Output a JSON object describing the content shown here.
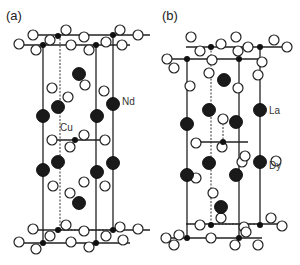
{
  "figure": {
    "panels": [
      {
        "id": "a",
        "label": "(a)",
        "label_pos": [
          6,
          20
        ],
        "atom_labels": [
          {
            "text": "Nd",
            "x": 122,
            "y": 101,
            "element": "Nd"
          },
          {
            "text": "Cu",
            "x": 60,
            "y": 127,
            "element": "Cu"
          }
        ],
        "solid_lines": [
          [
            [
              43,
              45
            ],
            [
              43,
              243
            ]
          ],
          [
            [
              96,
              45
            ],
            [
              96,
              243
            ]
          ],
          [
            [
              113,
              35
            ],
            [
              113,
              230
            ]
          ],
          [
            [
              36,
              35
            ],
            [
              150,
              35
            ]
          ],
          [
            [
              18,
              45
            ],
            [
              130,
              45
            ]
          ],
          [
            [
              18,
              243
            ],
            [
              130,
              243
            ]
          ],
          [
            [
              36,
              230
            ],
            [
              150,
              230
            ]
          ],
          [
            [
              55,
              140
            ],
            [
              103,
              140
            ]
          ]
        ],
        "dashed_lines": [
          [
            [
              60,
              35
            ],
            [
              60,
              230
            ]
          ],
          [
            [
              60,
              230
            ],
            [
              113,
              230
            ]
          ]
        ],
        "open_atoms": [
          [
            33,
            35
          ],
          [
            66,
            30
          ],
          [
            84,
            37
          ],
          [
            50,
            40
          ],
          [
            120,
            30
          ],
          [
            138,
            35
          ],
          [
            19,
            44
          ],
          [
            36,
            50
          ],
          [
            71,
            45
          ],
          [
            89,
            50
          ],
          [
            106,
            42
          ],
          [
            122,
            45
          ],
          [
            52,
            88
          ],
          [
            85,
            85
          ],
          [
            68,
            97
          ],
          [
            104,
            91
          ],
          [
            52,
            140
          ],
          [
            84,
            135
          ],
          [
            70,
            147
          ],
          [
            105,
            140
          ],
          [
            53,
            186
          ],
          [
            84,
            182
          ],
          [
            70,
            193
          ],
          [
            105,
            186
          ],
          [
            33,
            229
          ],
          [
            66,
            225
          ],
          [
            84,
            231
          ],
          [
            50,
            236
          ],
          [
            120,
            227
          ],
          [
            138,
            229
          ],
          [
            19,
            242
          ],
          [
            36,
            249
          ],
          [
            71,
            242
          ],
          [
            89,
            247
          ],
          [
            106,
            236
          ],
          [
            123,
            240
          ]
        ],
        "black_atoms_large": [
          [
            79,
            74
          ],
          [
            58,
            107
          ],
          [
            43,
            116
          ],
          [
            97,
            116
          ],
          [
            113,
            104
          ],
          [
            58,
            162
          ],
          [
            43,
            170
          ],
          [
            97,
            172
          ],
          [
            113,
            163
          ],
          [
            79,
            203
          ]
        ],
        "black_atoms_small": [
          [
            43,
            45
          ],
          [
            58,
            36
          ],
          [
            96,
            45
          ],
          [
            113,
            35
          ],
          [
            75,
            140
          ],
          [
            43,
            243
          ],
          [
            58,
            230
          ],
          [
            96,
            243
          ],
          [
            113,
            230
          ]
        ]
      },
      {
        "id": "b",
        "label": "(b)",
        "label_pos": [
          162,
          20
        ],
        "atom_labels": [
          {
            "text": "La",
            "x": 269,
            "y": 110,
            "element": "La"
          },
          {
            "text": "Dy",
            "x": 269,
            "y": 165,
            "element": "Dy"
          }
        ],
        "solid_lines": [
          [
            [
              187,
              59
            ],
            [
              187,
              238
            ]
          ],
          [
            [
              239,
              59
            ],
            [
              239,
              238
            ]
          ],
          [
            [
              260,
              47
            ],
            [
              260,
              224
            ]
          ],
          [
            [
              186,
              47
            ],
            [
              282,
              47
            ]
          ],
          [
            [
              166,
              59
            ],
            [
              262,
              59
            ]
          ],
          [
            [
              166,
              238
            ],
            [
              262,
              238
            ]
          ],
          [
            [
              186,
              224
            ],
            [
              282,
              224
            ]
          ],
          [
            [
              196,
              142
            ],
            [
              248,
              142
            ]
          ]
        ],
        "dashed_lines": [
          [
            [
              211,
              47
            ],
            [
              211,
              224
            ]
          ],
          [
            [
              223,
              120
            ],
            [
              223,
              148
            ]
          ],
          [
            [
              211,
              224
            ],
            [
              260,
              224
            ]
          ]
        ],
        "open_atoms": [
          [
            191,
            37
          ],
          [
            221,
            44
          ],
          [
            236,
            37
          ],
          [
            200,
            51
          ],
          [
            274,
            40
          ],
          [
            287,
            47
          ],
          [
            167,
            59
          ],
          [
            174,
            68
          ],
          [
            212,
            60
          ],
          [
            238,
            51
          ],
          [
            248,
            47
          ],
          [
            262,
            62
          ],
          [
            209,
            73
          ],
          [
            190,
            86
          ],
          [
            258,
            75
          ],
          [
            238,
            88
          ],
          [
            223,
            119
          ],
          [
            222,
            147
          ],
          [
            196,
            143
          ],
          [
            242,
            162
          ],
          [
            276,
            161
          ],
          [
            196,
            178
          ],
          [
            213,
            193
          ],
          [
            245,
            156
          ],
          [
            200,
            225
          ],
          [
            221,
            218
          ],
          [
            179,
            235
          ],
          [
            244,
            227
          ],
          [
            271,
            218
          ],
          [
            282,
            226
          ],
          [
            166,
            238
          ],
          [
            174,
            245
          ],
          [
            211,
            238
          ],
          [
            235,
            245
          ],
          [
            246,
            232
          ],
          [
            258,
            245
          ]
        ],
        "black_atoms_large": [
          [
            224,
            80
          ],
          [
            209,
            110
          ],
          [
            187,
            124
          ],
          [
            236,
            122
          ],
          [
            260,
            110
          ],
          [
            209,
            163
          ],
          [
            187,
            175
          ],
          [
            236,
            175
          ],
          [
            260,
            162
          ],
          [
            221,
            207
          ]
        ],
        "black_atoms_small": [
          [
            211,
            47
          ],
          [
            260,
            47
          ],
          [
            187,
            59
          ],
          [
            239,
            59
          ],
          [
            223,
            142
          ],
          [
            211,
            225
          ],
          [
            260,
            225
          ],
          [
            187,
            238
          ],
          [
            239,
            238
          ]
        ]
      }
    ]
  }
}
